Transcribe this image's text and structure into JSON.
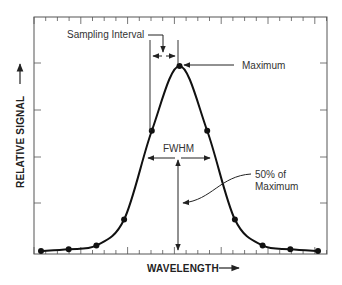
{
  "chart_data": {
    "type": "line",
    "title": "",
    "xlabel": "WAVELENGTH",
    "ylabel": "RELATIVE SIGNAL",
    "x": [
      0,
      1,
      2,
      3,
      4,
      5,
      6,
      7,
      8,
      9,
      10
    ],
    "series": [
      {
        "name": "Sampled spectral peak",
        "values": [
          0.0,
          0.01,
          0.03,
          0.17,
          0.65,
          1.0,
          0.65,
          0.17,
          0.03,
          0.01,
          0.0
        ]
      }
    ],
    "xlim": [
      -0.25,
      10.25
    ],
    "ylim": [
      -0.02,
      1.26
    ],
    "grid": false,
    "legend": "none",
    "annotations": [
      "Sampling Interval",
      "Maximum",
      "FWHM",
      "50% of Maximum"
    ]
  },
  "labels": {
    "sampling_interval": "Sampling Interval",
    "maximum": "Maximum",
    "fwhm": "FWHM",
    "half_max_line1": "50% of",
    "half_max_line2": "Maximum",
    "x_axis": "WAVELENGTH",
    "y_axis": "RELATIVE SIGNAL"
  },
  "colors": {
    "curve": "#111111",
    "frame": "#555555",
    "text": "#333333"
  }
}
